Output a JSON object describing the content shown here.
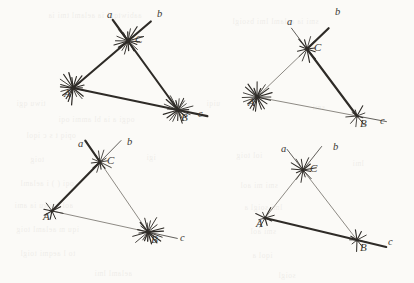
{
  "figure": {
    "kind": "geometry-diagram",
    "ink_color": "#2e2b27",
    "light_ink_color": "#5d5952",
    "paper_color": "#fbfaf7",
    "panels": [
      {
        "id": "top-left",
        "name": "panel-top-left",
        "vertices": [
          {
            "label": "A",
            "x": 73,
            "y": 88,
            "burst": "dense",
            "burst_rays": 20
          },
          {
            "label": "B",
            "x": 178,
            "y": 110,
            "burst": "dense",
            "burst_rays": 20
          },
          {
            "label": "C",
            "x": 128,
            "y": 41,
            "burst": "dense",
            "burst_rays": 18
          }
        ],
        "ray_labels": [
          {
            "label": "a",
            "x": 107,
            "y": 18
          },
          {
            "label": "b",
            "x": 157,
            "y": 17
          },
          {
            "label": "c",
            "x": 198,
            "y": 117
          }
        ],
        "side_weights": {
          "AB": "bold",
          "BC": "bold",
          "CA": "bold"
        }
      },
      {
        "id": "top-right",
        "name": "panel-top-right",
        "vertices": [
          {
            "label": "A",
            "x": 257,
            "y": 97,
            "burst": "dense",
            "burst_rays": 20
          },
          {
            "label": "B",
            "x": 357,
            "y": 116,
            "burst": "sparse",
            "burst_rays": 9
          },
          {
            "label": "C",
            "x": 307,
            "y": 49,
            "burst": "medium",
            "burst_rays": 12
          }
        ],
        "ray_labels": [
          {
            "label": "a",
            "x": 287,
            "y": 25
          },
          {
            "label": "b",
            "x": 335,
            "y": 15
          },
          {
            "label": "c",
            "x": 380,
            "y": 124
          }
        ],
        "side_weights": {
          "AB": "thin",
          "BC": "bold",
          "CA": "thin"
        }
      },
      {
        "id": "bottom-left",
        "name": "panel-bottom-left",
        "vertices": [
          {
            "label": "A",
            "x": 52,
            "y": 211,
            "burst": "sparse",
            "burst_rays": 8
          },
          {
            "label": "B",
            "x": 148,
            "y": 232,
            "burst": "dense",
            "burst_rays": 20
          },
          {
            "label": "C",
            "x": 100,
            "y": 162,
            "burst": "medium",
            "burst_rays": 12
          }
        ],
        "ray_labels": [
          {
            "label": "a",
            "x": 78,
            "y": 147
          },
          {
            "label": "b",
            "x": 127,
            "y": 145
          },
          {
            "label": "c",
            "x": 180,
            "y": 241
          }
        ],
        "side_weights": {
          "AB": "thin",
          "BC": "thin",
          "CA": "bold"
        }
      },
      {
        "id": "bottom-right",
        "name": "panel-bottom-right",
        "vertices": [
          {
            "label": "A",
            "x": 265,
            "y": 218,
            "burst": "sparse",
            "burst_rays": 8
          },
          {
            "label": "B",
            "x": 357,
            "y": 240,
            "burst": "sparse",
            "burst_rays": 9
          },
          {
            "label": "C",
            "x": 303,
            "y": 170,
            "burst": "medium",
            "burst_rays": 13
          }
        ],
        "ray_labels": [
          {
            "label": "a",
            "x": 281,
            "y": 152
          },
          {
            "label": "b",
            "x": 333,
            "y": 150
          },
          {
            "label": "c",
            "x": 388,
            "y": 245
          }
        ],
        "side_weights": {
          "AB": "bold",
          "BC": "thin",
          "CA": "thin"
        }
      }
    ]
  },
  "bleed_through": [
    {
      "text": "aabiwtqgi ia aelaml tmi ia",
      "x": 48,
      "y": 8
    },
    {
      "text": "smi ia aelaml lmi bsoigl",
      "x": 232,
      "y": 14
    },
    {
      "text": "tiwu qgi",
      "x": 16,
      "y": 96
    },
    {
      "text": "oqgi a ia bl ammi oqi",
      "x": 58,
      "y": 112
    },
    {
      "text": "opiq  t s c  iqol",
      "x": 26,
      "y": 128
    },
    {
      "text": "uiqi",
      "x": 206,
      "y": 96
    },
    {
      "text": "smi",
      "x": 312,
      "y": 100
    },
    {
      "text": "toig",
      "x": 30,
      "y": 152
    },
    {
      "text": "igi",
      "x": 146,
      "y": 150
    },
    {
      "text": "iol  toig",
      "x": 236,
      "y": 148
    },
    {
      "text": "lmi",
      "x": 352,
      "y": 156
    },
    {
      "text": "oqi  ( )  i aelaml",
      "x": 20,
      "y": 176
    },
    {
      "text": "smi  mi  aol",
      "x": 240,
      "y": 178
    },
    {
      "text": "aol  i  tiwu  ia  ami",
      "x": 14,
      "y": 198
    },
    {
      "text": "lmi  soigl  a",
      "x": 244,
      "y": 200
    },
    {
      "text": "iqu  m  aelaml  toig",
      "x": 16,
      "y": 222
    },
    {
      "text": "smi  aol",
      "x": 250,
      "y": 224
    },
    {
      "text": "to  l  aeqmi  toigl",
      "x": 20,
      "y": 246
    },
    {
      "text": "iqol  a",
      "x": 252,
      "y": 248
    },
    {
      "text": "aelaml  lmi",
      "x": 94,
      "y": 266
    },
    {
      "text": "soigl",
      "x": 278,
      "y": 268
    }
  ]
}
